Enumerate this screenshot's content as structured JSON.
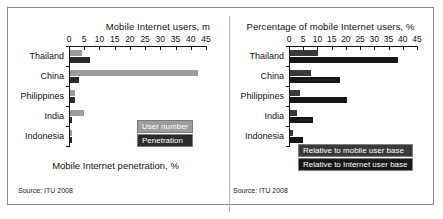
{
  "figure": {
    "source_note": "Source: ITU 2008"
  },
  "chart_data": [
    {
      "type": "bar",
      "orientation": "horizontal",
      "panel": "left",
      "title": "Mobile Internet users, m",
      "xlabel": "Mobile Internet penetration, %",
      "ylabel": "",
      "categories": [
        "Thailand",
        "China",
        "Philippines",
        "India",
        "Indonesia"
      ],
      "xlim": [
        0,
        45
      ],
      "xticks": [
        0,
        5,
        10,
        15,
        20,
        25,
        30,
        35,
        40,
        45
      ],
      "grid": false,
      "legend_position": "inside-right",
      "series": [
        {
          "name": "User number",
          "color": "#9d9d9d",
          "values": [
            4.0,
            42.0,
            1.5,
            4.5,
            0.8
          ]
        },
        {
          "name": "Penetration",
          "color": "#2b2b2b",
          "values": [
            6.5,
            3.0,
            1.8,
            0.5,
            0.7
          ]
        }
      ],
      "source": "Source: ITU 2008"
    },
    {
      "type": "bar",
      "orientation": "horizontal",
      "panel": "right",
      "title": "Percentage of mobile Internet users, %",
      "xlabel": "",
      "ylabel": "",
      "categories": [
        "Thailand",
        "China",
        "Philippines",
        "India",
        "Indonesia"
      ],
      "xlim": [
        0,
        45
      ],
      "xticks": [
        0,
        5,
        10,
        15,
        20,
        25,
        30,
        35,
        40,
        45
      ],
      "grid": false,
      "legend_position": "inside-right",
      "series": [
        {
          "name": "Relative to mobile user base",
          "color": "#3a3a3a",
          "values": [
            10.0,
            7.5,
            3.5,
            2.5,
            1.0
          ]
        },
        {
          "name": "Relative to Internet user base",
          "color": "#181818",
          "values": [
            38.0,
            17.5,
            20.0,
            8.0,
            4.5
          ]
        }
      ],
      "source": "Source: ITU 2008"
    }
  ]
}
